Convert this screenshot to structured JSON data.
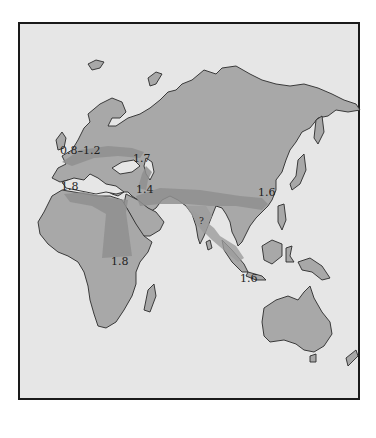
{
  "map": {
    "title": "",
    "type": "dispersal-routes map",
    "region": "Africa, Europe, Asia, Australasia",
    "colors": {
      "ocean": "#e6e6e6",
      "land": "#a8a8a8",
      "route": "#8f8f8f",
      "border": "#1a1a1a"
    },
    "labels": [
      {
        "id": "europe-west",
        "text": "0.8–1.2",
        "unit_hint": "million years ago"
      },
      {
        "id": "caucasus",
        "text": "1.7"
      },
      {
        "id": "north-africa",
        "text": "1.8"
      },
      {
        "id": "middle-east",
        "text": "1.4"
      },
      {
        "id": "china",
        "text": "1.6"
      },
      {
        "id": "india",
        "text": "?"
      },
      {
        "id": "east-africa",
        "text": "1.8"
      },
      {
        "id": "java",
        "text": "1.6"
      }
    ]
  }
}
